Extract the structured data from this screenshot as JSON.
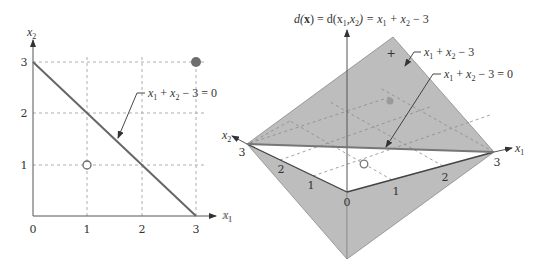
{
  "left_plot": {
    "x_axis_label": "x",
    "x_axis_sub": "1",
    "y_axis_label": "x",
    "y_axis_sub": "2",
    "x_ticks": [
      "0",
      "1",
      "2",
      "3"
    ],
    "y_ticks": [
      "1",
      "2",
      "3"
    ],
    "boundary_line": {
      "from": [
        0,
        3
      ],
      "to": [
        3,
        0
      ]
    },
    "points": [
      {
        "x": 1,
        "y": 1,
        "style": "open"
      },
      {
        "x": 3,
        "y": 3,
        "style": "filled"
      }
    ],
    "annotation": {
      "parts": [
        "x",
        "1",
        " + ",
        "x",
        "2",
        " − 3 = 0"
      ]
    },
    "colors": {
      "line": "#666666",
      "filled_point": "#6e6e6e",
      "grid": "#999999"
    }
  },
  "right_plot": {
    "title": {
      "parts": [
        "d(",
        "x",
        ") = d(x",
        "1",
        ",x",
        "2",
        ") = x",
        "1",
        " + x",
        "2",
        " − 3"
      ]
    },
    "x1_axis_label": "x",
    "x1_axis_sub": "1",
    "x2_axis_label": "x",
    "x2_axis_sub": "2",
    "origin_label": "0",
    "x1_ticks": [
      "1",
      "2",
      "3"
    ],
    "x2_ticks": [
      "1",
      "2",
      "3"
    ],
    "plus_sign": "+",
    "annotation_plane": {
      "parts": [
        "x",
        "1",
        " + ",
        "x",
        "2",
        " − 3"
      ]
    },
    "annotation_line": {
      "parts": [
        "x",
        "1",
        " + ",
        "x",
        "2",
        " − 3 = 0"
      ]
    },
    "ghost_label": {
      "text": "x",
      "sub": "1"
    },
    "colors": {
      "plane": "#bdbdbd",
      "plane_edge": "#8a8a8a",
      "boundary": "#777777"
    }
  }
}
